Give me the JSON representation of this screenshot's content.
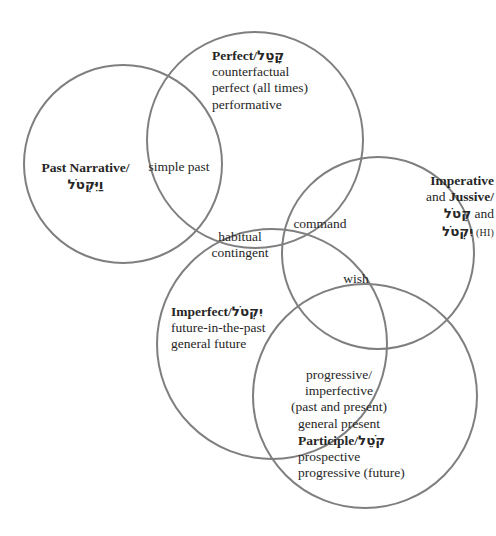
{
  "figure": {
    "type": "venn-diagram",
    "stroke_color": "#7f7f7f",
    "text_color": "#262626",
    "background": "#ffffff"
  },
  "circles": [
    {
      "id": "past-narrative",
      "cx": 123,
      "cy": 164,
      "r": 99
    },
    {
      "id": "perfect",
      "cx": 255,
      "cy": 140,
      "r": 108
    },
    {
      "id": "imperative",
      "cx": 378,
      "cy": 253,
      "r": 96
    },
    {
      "id": "imperfect",
      "cx": 272,
      "cy": 344,
      "r": 115
    },
    {
      "id": "participle",
      "cx": 365,
      "cy": 396,
      "r": 112
    }
  ],
  "labels": {
    "past_narrative": {
      "title": "Past Narrative/",
      "hebrew": "וַיִּקְטֹל"
    },
    "simple_past": {
      "text": "simple past"
    },
    "perfect": {
      "title": "Perfect/",
      "hebrew": "קָטַל",
      "lines": [
        "counterfactual",
        "perfect (all times)",
        "performative"
      ]
    },
    "imperative_jussive": {
      "title_1": "Imperative",
      "conj_1": "and ",
      "title_2": "Jussive/",
      "hebrew_1": "קְטֹל",
      "conj_2": " and",
      "hebrew_2": "יִקְטֹל",
      "suffix": " (HI)"
    },
    "command": {
      "text": "command"
    },
    "habitual": {
      "lines": [
        "habitual",
        "contingent"
      ]
    },
    "wish": {
      "text": "wish"
    },
    "imperfect": {
      "title": "Imperfect/",
      "hebrew": "יִקְטֹל",
      "lines": [
        "future-in-the-past",
        "general future"
      ]
    },
    "progressive": {
      "lines": [
        "progressive/",
        "imperfective",
        "(past and present)",
        "general present"
      ]
    },
    "participle": {
      "title": "Participle/",
      "hebrew": "קֹטֵל",
      "lines": [
        "prospective",
        "progressive (future)"
      ]
    }
  }
}
